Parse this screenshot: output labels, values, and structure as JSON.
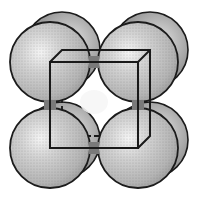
{
  "diagram": {
    "type": "crystal-lattice-unit-cell",
    "spheres": {
      "back": [
        {
          "id": "back-top-left",
          "cx": 62,
          "cy": 50,
          "r": 38
        },
        {
          "id": "back-top-right",
          "cx": 150,
          "cy": 50,
          "r": 38
        },
        {
          "id": "back-bottom-left",
          "cx": 62,
          "cy": 140,
          "r": 38
        },
        {
          "id": "back-bottom-right",
          "cx": 150,
          "cy": 140,
          "r": 38
        }
      ],
      "front": [
        {
          "id": "front-top-left",
          "cx": 50,
          "cy": 62,
          "r": 40
        },
        {
          "id": "front-top-right",
          "cx": 138,
          "cy": 62,
          "r": 40
        },
        {
          "id": "front-bottom-left",
          "cx": 50,
          "cy": 148,
          "r": 40
        },
        {
          "id": "front-bottom-right",
          "cx": 138,
          "cy": 148,
          "r": 40
        }
      ]
    },
    "cube": {
      "front_face": {
        "x1": 50,
        "y1": 62,
        "x2": 138,
        "y2": 148
      },
      "back_offset": {
        "dx": 12,
        "dy": -12
      }
    },
    "colors": {
      "sphere_fill": "#c8c8c8",
      "sphere_shadow": "#8c8c8c",
      "highlight": "#f4f4f4",
      "outline": "#1a1a1a",
      "background": "#ffffff"
    }
  }
}
